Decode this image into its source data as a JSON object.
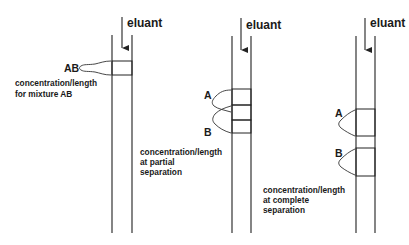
{
  "diagram": {
    "type": "column-chromatography-separation",
    "columns": [
      {
        "id": "mixture",
        "eluant_label": "eluant",
        "peak_labels": [
          "AB"
        ],
        "caption": [
          "concentration/length",
          "for mixture AB"
        ],
        "bands": [
          {
            "component": "AB",
            "pattern": "crosshatch"
          }
        ]
      },
      {
        "id": "partial",
        "eluant_label": "eluant",
        "peak_labels": [
          "A",
          "B"
        ],
        "caption": [
          "concentration/length",
          "at partial",
          "separation"
        ],
        "bands": [
          {
            "component": "A",
            "pattern": "hatch-forward"
          },
          {
            "component": "A+B overlap",
            "pattern": "crosshatch"
          },
          {
            "component": "B",
            "pattern": "hatch-back"
          }
        ]
      },
      {
        "id": "complete",
        "eluant_label": "eluant",
        "peak_labels": [
          "A",
          "B"
        ],
        "caption": [
          "concentration/length",
          "at complete",
          "separation"
        ],
        "bands": [
          {
            "component": "A",
            "pattern": "hatch-forward"
          },
          {
            "component": "B",
            "pattern": "hatch-back"
          }
        ]
      }
    ],
    "colors": {
      "line": "#333333",
      "text": "#1a1a1a",
      "background": "#ffffff"
    }
  }
}
